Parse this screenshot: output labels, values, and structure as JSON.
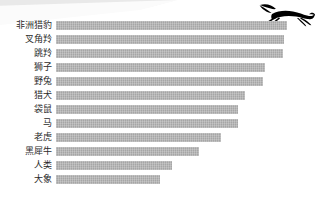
{
  "decor": {
    "swoosh_name": "swoosh-decoration",
    "cheetah_name": "running-cheetah-silhouette"
  },
  "style": {
    "bar_color": "#a6a6a6",
    "label_color": "#2b2b2b",
    "background": "#ffffff",
    "silhouette_color": "#000000"
  },
  "chart_data": {
    "type": "bar",
    "orientation": "horizontal",
    "title": "",
    "subtitle": "",
    "xlabel": "",
    "ylabel": "",
    "grid": false,
    "legend": false,
    "categories": [
      "非洲猎豹",
      "叉角羚",
      "跳羚",
      "狮子",
      "野兔",
      "猎犬",
      "袋鼠",
      "马",
      "老虎",
      "黑犀牛",
      "人类",
      "大象"
    ],
    "values": [
      100,
      98,
      97,
      90,
      89,
      81,
      78,
      78,
      71,
      62,
      50,
      45
    ],
    "xlim": [
      0,
      100
    ],
    "bar_pixel_widths": [
      231,
      228,
      227,
      209,
      207,
      189,
      182,
      182,
      165,
      143,
      116,
      104
    ]
  }
}
